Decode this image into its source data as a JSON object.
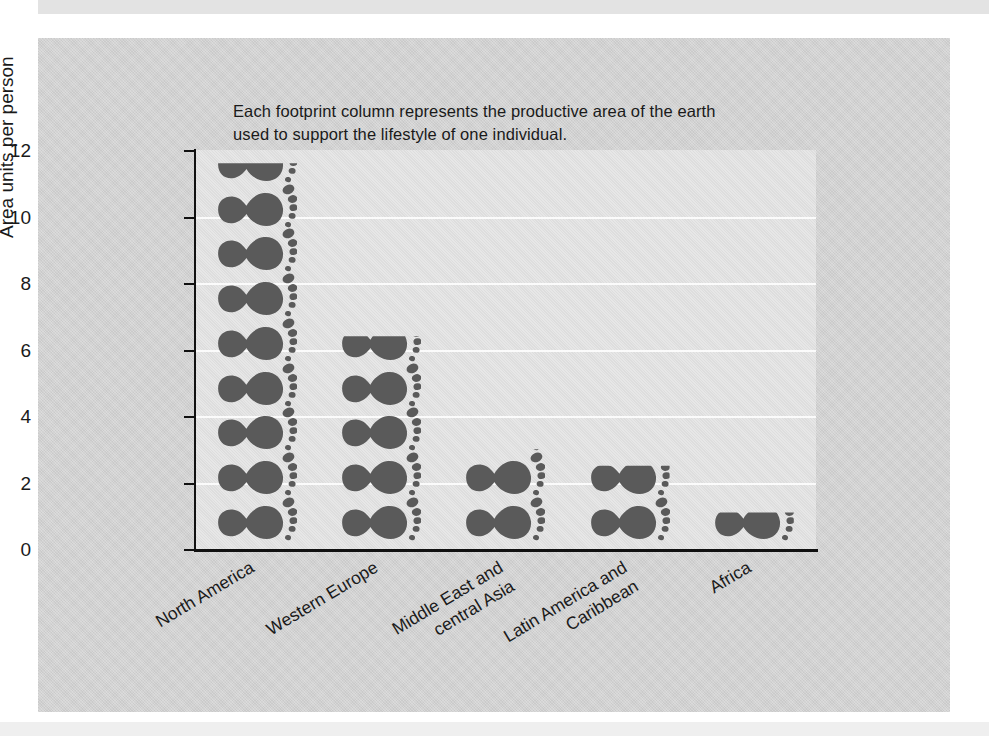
{
  "caption": {
    "line1": "Each footprint column represents the productive area of the earth",
    "line2": "used to support the lifestyle of one individual."
  },
  "chart_data": {
    "type": "bar",
    "title": "",
    "subtitle": "Each footprint column represents the productive area of the earth used to support the lifestyle of one individual.",
    "xlabel": "",
    "ylabel": "Area units per person",
    "categories": [
      "North America",
      "Western Europe",
      "Middle East and central Asia",
      "Latin America and Caribbean",
      "Africa"
    ],
    "category_lines": [
      [
        "North America"
      ],
      [
        "Western Europe"
      ],
      [
        "Middle East and",
        "central Asia"
      ],
      [
        "Latin America and",
        "Caribbean"
      ],
      [
        "Africa"
      ]
    ],
    "values": [
      11.6,
      6.4,
      3.0,
      2.5,
      1.1
    ],
    "footprint_counts": [
      9,
      5,
      3,
      2,
      1
    ],
    "ylim": [
      0,
      12
    ],
    "yticks": [
      0,
      2,
      4,
      6,
      8,
      10,
      12
    ],
    "grid": true,
    "gridlines_at": [
      2,
      4,
      6,
      8,
      10
    ],
    "legend": "none",
    "unit_note": "Each footprint glyph represents approximately 1.25 area units per person",
    "glyph": "footprint-icon",
    "colors": {
      "footprint": "#5a5a5a",
      "plot_background": "#e0e0e0",
      "page_background": "#cfcfcf",
      "gridline": "#fbfbfb",
      "axis": "#111111",
      "text": "#1a1a1a"
    }
  },
  "y_axis": {
    "title": "Area units per person",
    "ticks": [
      "0",
      "2",
      "4",
      "6",
      "8",
      "10",
      "12"
    ]
  }
}
